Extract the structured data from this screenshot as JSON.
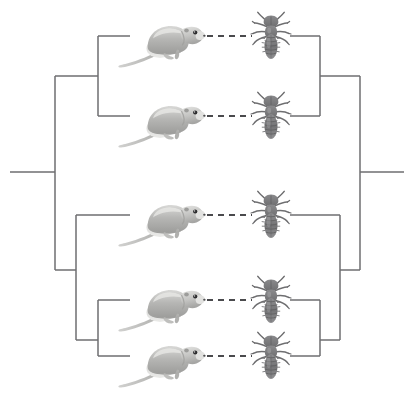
{
  "figure": {
    "kind": "cophylogeny-tanglegram",
    "width": 414,
    "height": 397,
    "background_color": "#ffffff",
    "branch_color": "#6e6e70",
    "link_color": "#4a4a4d",
    "host_icon": "pocket-gopher-icon",
    "parasite_icon": "chewing-louse-icon",
    "host_tree_name": "host-tree-gophers",
    "parasite_tree_name": "parasite-tree-lice"
  },
  "chart_data": {
    "type": "diagram",
    "title": "",
    "subtitle": "",
    "xlabel": "",
    "ylabel": "",
    "legend": [],
    "annotations": [],
    "tip_count": 5,
    "tip_rows_y": [
      36,
      116,
      215,
      300,
      356
    ],
    "host_tree": {
      "orientation": "right-to-left-mirrored",
      "root_stem": {
        "x1": 10,
        "x2": 55,
        "y": 172
      },
      "tips": [
        {
          "name": "host-tip-1",
          "row": 0,
          "y": 36,
          "x_tip": 130,
          "x_node": 98
        },
        {
          "name": "host-tip-2",
          "row": 1,
          "y": 116,
          "x_tip": 130,
          "x_node": 98
        },
        {
          "name": "host-tip-3",
          "row": 2,
          "y": 215,
          "x_tip": 130,
          "x_node": 76
        },
        {
          "name": "host-tip-4",
          "row": 3,
          "y": 300,
          "x_tip": 130,
          "x_node": 98
        },
        {
          "name": "host-tip-5",
          "row": 4,
          "y": 356,
          "x_tip": 130,
          "x_node": 98
        }
      ],
      "nodes": [
        {
          "name": "host-node-A",
          "x": 98,
          "y_top": 36,
          "y_bottom": 116,
          "y_parent": 76,
          "parent_x": 55
        },
        {
          "name": "host-node-B",
          "x": 98,
          "y_top": 300,
          "y_bottom": 356,
          "y_parent": 340,
          "parent_x": 76
        },
        {
          "name": "host-node-C",
          "x": 76,
          "y_top": 215,
          "y_bottom": 340,
          "y_parent": 270,
          "parent_x": 55
        },
        {
          "name": "host-node-root",
          "x": 55,
          "y_top": 76,
          "y_bottom": 270,
          "y_parent": 172,
          "parent_x": 10
        }
      ]
    },
    "parasite_tree": {
      "orientation": "left-to-right",
      "root_stem": {
        "x1": 360,
        "x2": 404,
        "y": 172
      },
      "tips": [
        {
          "name": "parasite-tip-1",
          "row": 0,
          "y": 36,
          "x_tip": 290,
          "x_node": 320
        },
        {
          "name": "parasite-tip-2",
          "row": 1,
          "y": 116,
          "x_tip": 290,
          "x_node": 320
        },
        {
          "name": "parasite-tip-3",
          "row": 2,
          "y": 215,
          "x_tip": 290,
          "x_node": 340
        },
        {
          "name": "parasite-tip-4",
          "row": 3,
          "y": 300,
          "x_tip": 290,
          "x_node": 320
        },
        {
          "name": "parasite-tip-5",
          "row": 4,
          "y": 356,
          "x_tip": 290,
          "x_node": 320
        }
      ],
      "nodes": [
        {
          "name": "parasite-node-A",
          "x": 320,
          "y_top": 36,
          "y_bottom": 116,
          "y_parent": 76,
          "parent_x": 360
        },
        {
          "name": "parasite-node-B",
          "x": 320,
          "y_top": 300,
          "y_bottom": 356,
          "y_parent": 340,
          "parent_x": 340
        },
        {
          "name": "parasite-node-C",
          "x": 340,
          "y_top": 215,
          "y_bottom": 340,
          "y_parent": 270,
          "parent_x": 360
        },
        {
          "name": "parasite-node-root",
          "x": 360,
          "y_top": 76,
          "y_bottom": 270,
          "y_parent": 172,
          "parent_x": 404
        }
      ]
    },
    "associations": [
      {
        "name": "assoc-link-1",
        "host_row": 0,
        "parasite_row": 0,
        "y": 36,
        "x1": 196,
        "x2": 252
      },
      {
        "name": "assoc-link-2",
        "host_row": 1,
        "parasite_row": 1,
        "y": 116,
        "x1": 196,
        "x2": 252
      },
      {
        "name": "assoc-link-3",
        "host_row": 2,
        "parasite_row": 2,
        "y": 215,
        "x1": 196,
        "x2": 252
      },
      {
        "name": "assoc-link-4",
        "host_row": 3,
        "parasite_row": 3,
        "y": 300,
        "x1": 196,
        "x2": 252
      },
      {
        "name": "assoc-link-5",
        "host_row": 4,
        "parasite_row": 4,
        "y": 356,
        "x1": 196,
        "x2": 252
      }
    ],
    "host_images": [
      {
        "name": "gopher-image-1",
        "cx": 163,
        "cy": 40
      },
      {
        "name": "gopher-image-2",
        "cx": 163,
        "cy": 120
      },
      {
        "name": "gopher-image-3",
        "cx": 163,
        "cy": 219
      },
      {
        "name": "gopher-image-4",
        "cx": 163,
        "cy": 304
      },
      {
        "name": "gopher-image-5",
        "cx": 163,
        "cy": 360
      }
    ],
    "parasite_images": [
      {
        "name": "louse-image-1",
        "cx": 271,
        "cy": 36
      },
      {
        "name": "louse-image-2",
        "cx": 271,
        "cy": 116
      },
      {
        "name": "louse-image-3",
        "cx": 271,
        "cy": 215
      },
      {
        "name": "louse-image-4",
        "cx": 271,
        "cy": 300
      },
      {
        "name": "louse-image-5",
        "cx": 271,
        "cy": 356
      }
    ]
  }
}
